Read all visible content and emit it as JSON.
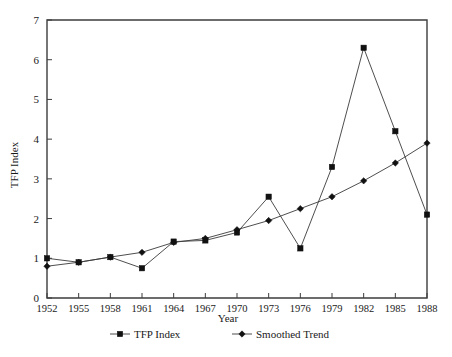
{
  "chart_data": {
    "type": "line",
    "title": "",
    "xlabel": "Year",
    "ylabel": "TFP Index",
    "xlim": [
      1952,
      1988
    ],
    "ylim": [
      0,
      7
    ],
    "yticks": [
      0,
      1,
      2,
      3,
      4,
      5,
      6,
      7
    ],
    "grid": false,
    "legend_position": "bottom",
    "categories": [
      1952,
      1955,
      1958,
      1961,
      1964,
      1967,
      1970,
      1973,
      1976,
      1979,
      1982,
      1985,
      1988
    ],
    "xtick_labels": [
      "1952",
      "1955",
      "1958",
      "1961",
      "1964",
      "1967",
      "1970",
      "1973",
      "1976",
      "1979",
      "1982",
      "1985",
      "1988"
    ],
    "ytick_labels": [
      "0",
      "1",
      "2",
      "3",
      "4",
      "5",
      "6",
      "7"
    ],
    "series": [
      {
        "name": "TFP Index",
        "marker": "square",
        "values": [
          1.0,
          0.9,
          1.03,
          0.75,
          1.42,
          1.45,
          1.65,
          2.55,
          1.25,
          3.3,
          6.3,
          4.2,
          2.1
        ]
      },
      {
        "name": "Smoothed Trend",
        "marker": "diamond",
        "values": [
          0.8,
          0.9,
          1.03,
          1.15,
          1.4,
          1.5,
          1.72,
          1.95,
          2.25,
          2.55,
          2.95,
          3.4,
          3.9
        ]
      }
    ]
  },
  "legend": {
    "items": [
      {
        "label": "TFP Index",
        "marker": "square"
      },
      {
        "label": "Smoothed Trend",
        "marker": "diamond"
      }
    ]
  },
  "colors": {
    "line": "#3a3a3a",
    "marker": "#111111",
    "frame": "#3d3d3d",
    "text": "#1a1a1a",
    "background": "#ffffff"
  }
}
